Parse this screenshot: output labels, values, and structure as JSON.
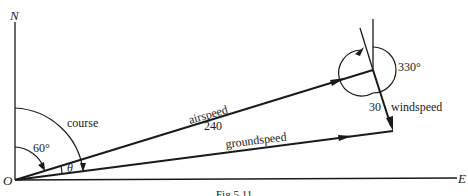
{
  "diagram": {
    "type": "vector-navigation",
    "axes": {
      "north_label": "N",
      "east_label": "E",
      "origin_label": "O"
    },
    "vectors": {
      "airspeed": {
        "label": "airspeed",
        "magnitude": "240"
      },
      "groundspeed": {
        "label": "groundspeed"
      },
      "windspeed": {
        "label": "windspeed",
        "magnitude": "30"
      }
    },
    "angles": {
      "heading_angle": "60°",
      "course_label": "course",
      "theta_label": "θ",
      "wind_bearing": "330°"
    },
    "caption": "Fig 5.11"
  },
  "colors": {
    "ink": "#1a1a1a",
    "background": "#ffffff"
  }
}
